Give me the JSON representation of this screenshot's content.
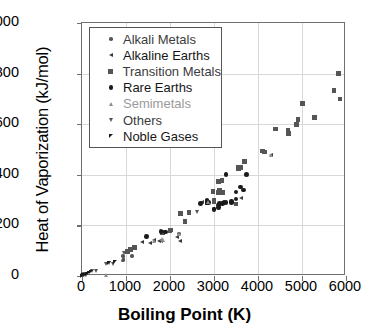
{
  "chart_data": {
    "type": "scatter",
    "title": "",
    "xlabel": "Boiling Point (K)",
    "ylabel": "Heat of Vaporization (kJ/mol)",
    "xlim": [
      0,
      6000
    ],
    "ylim": [
      0,
      1000
    ],
    "xticks": [
      "0",
      "1000",
      "2000",
      "3000",
      "4000",
      "5000",
      "6000"
    ],
    "yticks": [
      "0",
      "200",
      "400",
      "600",
      "800",
      "1000"
    ],
    "xtick_values": [
      0,
      1000,
      2000,
      3000,
      4000,
      5000,
      6000
    ],
    "ytick_values": [
      0,
      200,
      400,
      600,
      800,
      1000
    ],
    "grid": true,
    "legend_position": "upper-left-inside",
    "series": [
      {
        "name": "Alkali Metals",
        "marker": "circle-small",
        "color": "#555555",
        "points": [
          [
            20,
            0.9
          ],
          [
            27,
            6.5
          ],
          [
            1032,
            97
          ],
          [
            944,
            77
          ],
          [
            1156,
            77
          ],
          [
            961,
            64
          ],
          [
            944,
            59
          ],
          [
            2223,
            165
          ]
        ]
      },
      {
        "name": "Alkaline Earths",
        "marker": "triangle-left",
        "color": "#3a3a3a",
        "points": [
          [
            2742,
            292
          ],
          [
            1560,
            128
          ],
          [
            1363,
            132
          ],
          [
            1757,
            137
          ],
          [
            1655,
            142
          ],
          [
            1800,
            136
          ],
          [
            2170,
            154
          ],
          [
            3618,
            305
          ],
          [
            4300,
            477
          ],
          [
            2237,
            136
          ]
        ]
      },
      {
        "name": "Transition Metals",
        "marker": "square",
        "color": "#555555",
        "points": [
          [
            3560,
            425
          ],
          [
            3695,
            452
          ],
          [
            3109,
            373
          ],
          [
            3186,
            377
          ],
          [
            3141,
            339
          ],
          [
            2980,
            334
          ],
          [
            2840,
            290
          ],
          [
            3000,
            300
          ],
          [
            3109,
            330
          ],
          [
            3695,
            452
          ],
          [
            4098,
            493
          ],
          [
            4150,
            490
          ],
          [
            4404,
            580
          ],
          [
            4682,
            577
          ],
          [
            4700,
            563
          ],
          [
            4912,
            619
          ],
          [
            5017,
            682
          ],
          [
            5285,
            627
          ],
          [
            5828,
            799
          ],
          [
            5731,
            732
          ],
          [
            5869,
            700
          ],
          [
            4876,
            598
          ],
          [
            2435,
            251
          ],
          [
            2345,
            216
          ],
          [
            2237,
            246
          ],
          [
            3129,
            340
          ],
          [
            1180,
            115
          ],
          [
            1211,
            112
          ],
          [
            1040,
            99
          ],
          [
            1100,
            105
          ],
          [
            2840,
            293
          ],
          [
            3000,
            295
          ],
          [
            3560,
            430
          ],
          [
            2023,
            181
          ],
          [
            3600,
            428
          ],
          [
            3200,
            330
          ],
          [
            1040,
            96
          ],
          [
            2000,
            179
          ],
          [
            1835,
            172
          ],
          [
            3503,
            284
          ]
        ]
      },
      {
        "name": "Rare Earths",
        "marker": "circle",
        "color": "#1a1a1a",
        "points": [
          [
            3273,
            400
          ],
          [
            3503,
            331
          ],
          [
            3675,
            340
          ],
          [
            3737,
            400
          ],
          [
            3273,
            290
          ],
          [
            3130,
            285
          ],
          [
            3000,
            262
          ],
          [
            3100,
            280
          ],
          [
            3200,
            285
          ],
          [
            3400,
            290
          ],
          [
            3500,
            304
          ],
          [
            3600,
            352
          ],
          [
            2840,
            290
          ],
          [
            2700,
            285
          ],
          [
            2880,
            291
          ],
          [
            3402,
            293
          ],
          [
            3230,
            290
          ],
          [
            1802,
            175
          ],
          [
            1469,
            155
          ],
          [
            1900,
            173
          ],
          [
            2840,
            300
          ],
          [
            3100,
            270
          ],
          [
            3000,
            265
          ]
        ]
      },
      {
        "name": "Semimetals",
        "marker": "triangle-up",
        "color": "#8e8e8e",
        "points": [
          [
            1860,
            141
          ],
          [
            1655,
            135
          ],
          [
            553,
            2
          ],
          [
            2875,
            290
          ],
          [
            1837,
            143
          ],
          [
            4300,
            478
          ],
          [
            2223,
            165
          ]
        ]
      },
      {
        "name": "Others",
        "marker": "triangle-down",
        "color": "#555555",
        "points": [
          [
            90,
            3
          ],
          [
            77,
            3
          ],
          [
            85,
            5
          ],
          [
            239,
            17
          ],
          [
            332,
            20
          ],
          [
            553,
            45
          ],
          [
            629,
            50
          ],
          [
            717,
            45
          ],
          [
            958,
            90
          ],
          [
            2628,
            250
          ],
          [
            2022,
            180
          ],
          [
            1180,
            110
          ]
        ]
      },
      {
        "name": "Noble Gases",
        "marker": "triangle-nw",
        "color": "#1a1a1a",
        "points": [
          [
            4,
            0.08
          ],
          [
            27,
            0.5
          ],
          [
            87,
            1.7
          ],
          [
            120,
            6.4
          ],
          [
            165,
            9.1
          ],
          [
            211,
            12.6
          ],
          [
            630,
            48
          ],
          [
            750,
            55
          ]
        ]
      }
    ]
  },
  "legend": {
    "items": [
      {
        "label": "Alkali Metals",
        "marker": "circle-small",
        "tone": "mid"
      },
      {
        "label": "Alkaline Earths",
        "marker": "triangle-left",
        "tone": "dark"
      },
      {
        "label": "Transition Metals",
        "marker": "square",
        "tone": "mid"
      },
      {
        "label": "Rare Earths",
        "marker": "circle",
        "tone": "dark"
      },
      {
        "label": "Semimetals",
        "marker": "triangle-up",
        "tone": "light"
      },
      {
        "label": "Others",
        "marker": "triangle-down",
        "tone": "mid"
      },
      {
        "label": "Noble Gases",
        "marker": "triangle-nw",
        "tone": "dark"
      }
    ]
  }
}
